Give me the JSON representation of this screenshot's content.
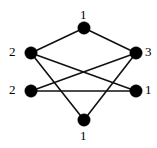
{
  "figure": {
    "kind": "undirected-graph-diagram",
    "background_color": "#ffffff",
    "width": 157,
    "height": 148
  },
  "style": {
    "vertex_color": "#000000",
    "edge_color": "#111111",
    "label_color": "#000000",
    "vertex_radius": 6.2,
    "edge_width": 1.6
  },
  "graph": {
    "vertices": [
      {
        "id": "top",
        "label": "1",
        "x": 84,
        "y": 28,
        "label_x": 80,
        "label_y": 8,
        "label_position": "above"
      },
      {
        "id": "upper-left",
        "label": "2",
        "x": 31,
        "y": 53,
        "label_x": 9,
        "label_y": 45,
        "label_position": "left"
      },
      {
        "id": "upper-right",
        "label": "3",
        "x": 136,
        "y": 53,
        "label_x": 145,
        "label_y": 45,
        "label_position": "right"
      },
      {
        "id": "lower-left",
        "label": "2",
        "x": 31,
        "y": 91,
        "label_x": 9,
        "label_y": 83,
        "label_position": "left"
      },
      {
        "id": "lower-right",
        "label": "1",
        "x": 136,
        "y": 91,
        "label_x": 145,
        "label_y": 83,
        "label_position": "right"
      },
      {
        "id": "bottom",
        "label": "1",
        "x": 84,
        "y": 120,
        "label_x": 80,
        "label_y": 129,
        "label_position": "below"
      }
    ],
    "edges": [
      {
        "id": "e1",
        "from": "top",
        "to": "upper-left",
        "x1": 84,
        "y1": 28,
        "x2": 31,
        "y2": 53
      },
      {
        "id": "e2",
        "from": "top",
        "to": "upper-right",
        "x1": 84,
        "y1": 28,
        "x2": 136,
        "y2": 53
      },
      {
        "id": "e3",
        "from": "upper-left",
        "to": "lower-right",
        "x1": 31,
        "y1": 53,
        "x2": 136,
        "y2": 91
      },
      {
        "id": "e4",
        "from": "upper-right",
        "to": "lower-left",
        "x1": 136,
        "y1": 53,
        "x2": 31,
        "y2": 91
      },
      {
        "id": "e5",
        "from": "lower-left",
        "to": "lower-right",
        "x1": 31,
        "y1": 91,
        "x2": 136,
        "y2": 91
      },
      {
        "id": "e6",
        "from": "upper-left",
        "to": "bottom",
        "x1": 31,
        "y1": 53,
        "x2": 84,
        "y2": 120
      },
      {
        "id": "e7",
        "from": "upper-right",
        "to": "bottom",
        "x1": 136,
        "y1": 53,
        "x2": 84,
        "y2": 120
      }
    ],
    "labels_all": [
      "1",
      "2",
      "3",
      "2",
      "1",
      "1"
    ]
  }
}
